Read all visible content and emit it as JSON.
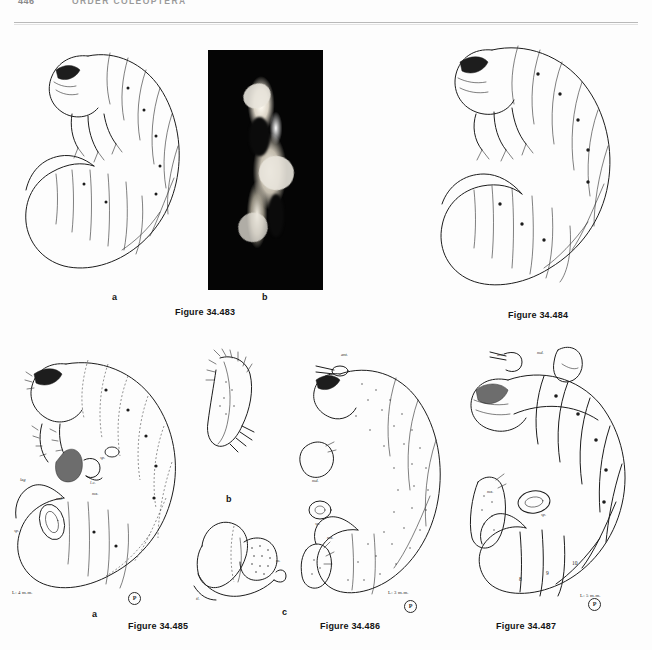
{
  "page": {
    "folio": "446",
    "running_head": "ORDER COLEOPTERA",
    "background_color": "#fdfdfd",
    "ink_color": "#1c1c1c"
  },
  "figures": [
    {
      "id": "fig-34-483",
      "caption": "Figure 34.483",
      "subfigures": [
        {
          "letter": "a",
          "kind": "line-drawing",
          "subject": "scarabaeiform larva, lateral view"
        },
        {
          "letter": "b",
          "kind": "photograph",
          "subject": "dissected mouthpart, dark field"
        }
      ],
      "annotations": [],
      "scale": "",
      "credit": ""
    },
    {
      "id": "fig-34-484",
      "caption": "Figure 34.484",
      "subfigures": [
        {
          "letter": "",
          "kind": "line-drawing",
          "subject": "scarabaeiform larva, lateral view"
        }
      ],
      "annotations": [],
      "scale": "",
      "credit": ""
    },
    {
      "id": "fig-34-485",
      "caption": "Figure 34.485",
      "subfigures": [
        {
          "letter": "a",
          "kind": "line-drawing",
          "subject": "larva, lateral habitus with mouthparts"
        },
        {
          "letter": "b",
          "kind": "line-drawing",
          "subject": "maxilla detail"
        },
        {
          "letter": "c",
          "kind": "line-drawing",
          "subject": "epipharynx / labrum detail"
        }
      ],
      "annotations": [
        {
          "text": "ant.",
          "meaning": "antenna"
        },
        {
          "text": "l.c.",
          "meaning": "lacinia"
        },
        {
          "text": "mx.",
          "meaning": "maxilla"
        },
        {
          "text": "md.",
          "meaning": "mandible"
        },
        {
          "text": "sp.",
          "meaning": "spiracle"
        },
        {
          "text": "leg",
          "meaning": "leg"
        },
        {
          "text": "m.",
          "meaning": "mala"
        },
        {
          "text": "tl.",
          "meaning": "tormal process"
        }
      ],
      "scale": "L: 4 m.m.",
      "credit": "P"
    },
    {
      "id": "fig-34-486",
      "caption": "Figure 34.486",
      "subfigures": [
        {
          "letter": "",
          "kind": "line-drawing",
          "subject": "larva, lateral habitus with mouthparts"
        }
      ],
      "annotations": [
        {
          "text": "ant.",
          "meaning": "antenna"
        },
        {
          "text": "md.",
          "meaning": "mandible"
        },
        {
          "text": "sp.",
          "meaning": "spiracle"
        },
        {
          "text": "mx.",
          "meaning": "maxilla"
        }
      ],
      "scale": "L: 3 m.m.",
      "credit": "P"
    },
    {
      "id": "fig-34-487",
      "caption": "Figure 34.487",
      "subfigures": [
        {
          "letter": "",
          "kind": "line-drawing",
          "subject": "larva, lateral habitus with mouthparts"
        }
      ],
      "annotations": [
        {
          "text": "ant.",
          "meaning": "antenna"
        },
        {
          "text": "md.",
          "meaning": "mandible"
        },
        {
          "text": "mx.",
          "meaning": "maxilla"
        },
        {
          "text": "sp.",
          "meaning": "spiracle"
        }
      ],
      "segment_numbers": [
        "8",
        "9",
        "10"
      ],
      "scale": "L: 5 m.m.",
      "credit": "P"
    }
  ]
}
